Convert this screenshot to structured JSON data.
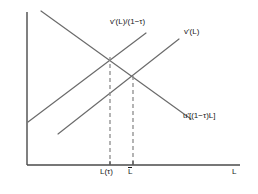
{
  "figure": {
    "type": "economics-line-diagram",
    "width": 258,
    "height": 194,
    "background": "#ffffff"
  },
  "axes": {
    "origin": {
      "x": 27,
      "y": 165
    },
    "x_axis": {
      "from_x": 27,
      "to_x": 240,
      "y": 165,
      "label": "L"
    },
    "y_axis": {
      "x": 27,
      "from_y": 12,
      "to_y": 165,
      "label": ""
    },
    "color": "#4a4a4a"
  },
  "curves": [
    {
      "id": "supply-taxed",
      "label": "v'(L)/(1−τ)",
      "direction": "upward",
      "color": "#6b6b6b",
      "from": {
        "x": 28,
        "y": 122
      },
      "to": {
        "x": 146,
        "y": 33
      }
    },
    {
      "id": "supply",
      "label": "v'(L)",
      "direction": "upward",
      "color": "#6b6b6b",
      "from": {
        "x": 58,
        "y": 134
      },
      "to": {
        "x": 179,
        "y": 39
      }
    },
    {
      "id": "demand",
      "label": "u'[(1−τ)L]",
      "direction": "downward",
      "color": "#6b6b6b",
      "from": {
        "x": 41,
        "y": 11
      },
      "to": {
        "x": 191,
        "y": 119
      }
    }
  ],
  "intersections": [
    {
      "id": "taxed-equilibrium",
      "x": 110,
      "y": 57
    },
    {
      "id": "efficient-equilibrium",
      "x": 133,
      "y": 76
    }
  ],
  "guides": [
    {
      "id": "guide-ltau",
      "x": 110,
      "from_y": 57,
      "to_y": 165,
      "color": "#8c8c8c",
      "dashed": true
    },
    {
      "id": "guide-lbar",
      "x": 133,
      "from_y": 76,
      "to_y": 165,
      "color": "#8c8c8c",
      "dashed": true
    }
  ],
  "x_ticks": [
    {
      "id": "tick-ltau",
      "x": 110,
      "label": "L(τ)"
    },
    {
      "id": "tick-lbar",
      "x": 133,
      "label": "L",
      "overbar": true
    }
  ],
  "labels": {
    "supply_taxed": "v'(L)/(1−τ)",
    "supply": "v'(L)",
    "demand": "u'[(1−τ)L]",
    "tick_ltau": "L(τ)",
    "tick_lbar": "L",
    "axis_x": "L"
  }
}
